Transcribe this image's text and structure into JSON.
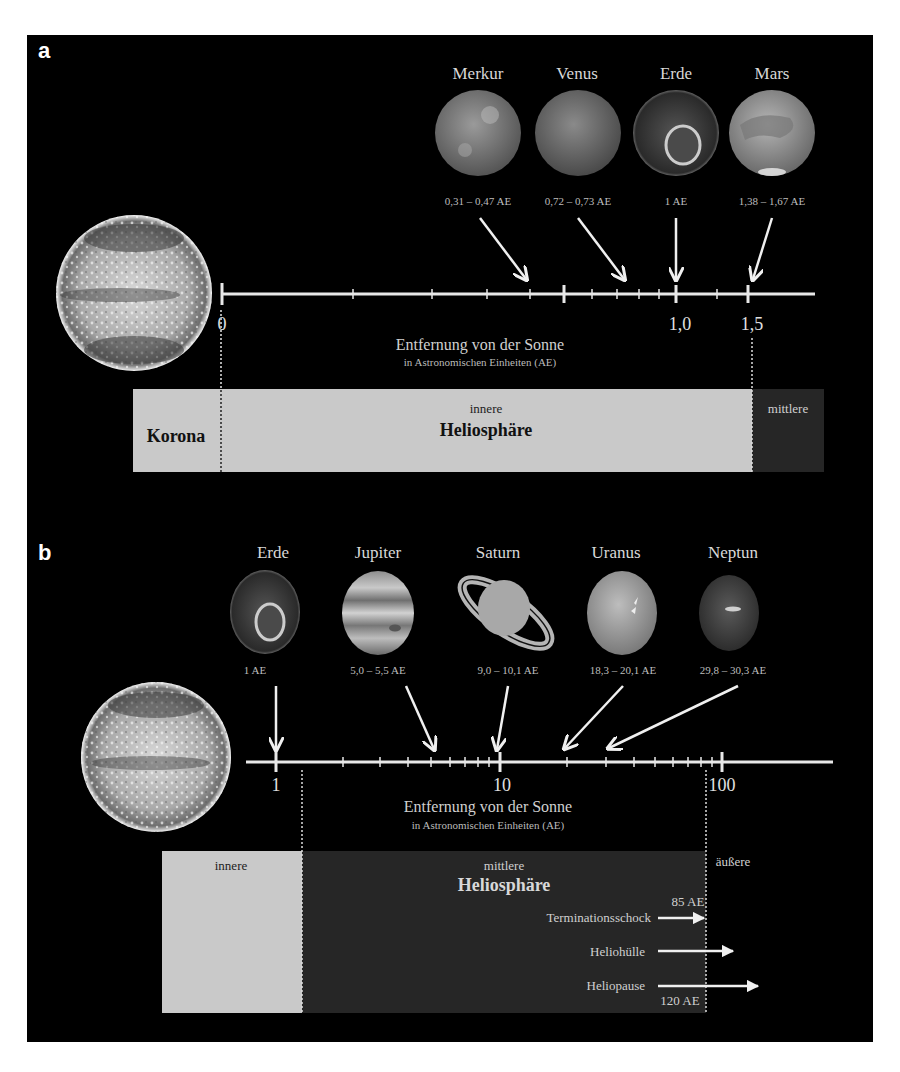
{
  "panels": {
    "a": {
      "letter": "a",
      "planets": [
        {
          "name": "Merkur",
          "distance": "0,31 – 0,47 AE"
        },
        {
          "name": "Venus",
          "distance": "0,72 – 0,73 AE"
        },
        {
          "name": "Erde",
          "distance": "1 AE"
        },
        {
          "name": "Mars",
          "distance": "1,38 – 1,67 AE"
        }
      ],
      "axis": {
        "ticks": [
          "0",
          "1,0",
          "1,5"
        ],
        "title": "Entfernung von der Sonne",
        "subtitle": "in Astronomischen Einheiten (AE)"
      },
      "regions": {
        "korona": "Korona",
        "inner_small": "innere",
        "inner_big": "Heliosphäre",
        "middle": "mittlere"
      }
    },
    "b": {
      "letter": "b",
      "planets": [
        {
          "name": "Erde",
          "distance": "1 AE"
        },
        {
          "name": "Jupiter",
          "distance": "5,0 – 5,5 AE"
        },
        {
          "name": "Saturn",
          "distance": "9,0 – 10,1 AE"
        },
        {
          "name": "Uranus",
          "distance": "18,3 – 20,1 AE"
        },
        {
          "name": "Neptun",
          "distance": "29,8 – 30,3 AE"
        }
      ],
      "axis": {
        "ticks": [
          "1",
          "10",
          "100"
        ],
        "title": "Entfernung von der Sonne",
        "subtitle": "in Astronomischen Einheiten (AE)"
      },
      "regions": {
        "inner": "innere",
        "middle_small": "mittlere",
        "middle_big": "Heliosphäre",
        "outer": "äußere"
      },
      "boundaries": [
        {
          "label": "Terminationsschock",
          "value": "85 AE"
        },
        {
          "label": "Heliohülle",
          "value": ""
        },
        {
          "label": "Heliopause",
          "value": "120 AE"
        }
      ]
    }
  },
  "colors": {
    "background": "#000000",
    "inner_region": "#c9c9c9",
    "middle_region": "#262626",
    "axis": "#e8e8e8"
  }
}
